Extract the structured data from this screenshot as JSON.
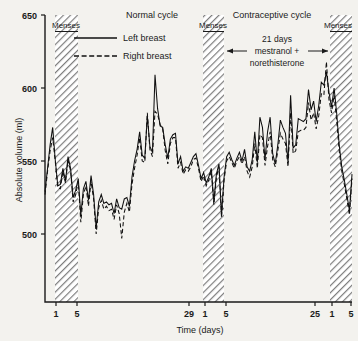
{
  "figure": {
    "background_color": "#f3f2ee",
    "ink_color": "#101010"
  },
  "headers": [
    {
      "name": "normal-cycle",
      "label": "Normal cycle",
      "x": 152
    },
    {
      "name": "contraceptive-cycle",
      "label": "Contraceptive cycle",
      "x": 272
    }
  ],
  "menses_bands": [
    {
      "name": "menses-band-1",
      "label": "Menses",
      "x_start": 55,
      "x_end": 78,
      "label_x": 66
    },
    {
      "name": "menses-band-2",
      "label": "Menses",
      "x_start": 203,
      "x_end": 224,
      "label_x": 213
    },
    {
      "name": "menses-band-3",
      "label": "Menses",
      "x_start": 330,
      "x_end": 352,
      "label_x": 338
    }
  ],
  "legend": {
    "items": [
      {
        "name": "legend-left-breast",
        "label": "Left breast",
        "style": "solid"
      },
      {
        "name": "legend-right-breast",
        "label": "Right breast",
        "style": "dashed"
      }
    ]
  },
  "annotation": {
    "line1": "21 days",
    "line2": "mestranol +",
    "line3": "norethisterone",
    "arrow_left_x": 227,
    "arrow_right_x": 328
  },
  "axes": {
    "y": {
      "title": "Absolute volume (ml)",
      "ticks": [
        650,
        600,
        550,
        500
      ],
      "min": 470,
      "max": 650
    },
    "x": {
      "title": "Time (days)",
      "ticks": [
        {
          "label": "1",
          "x": 56
        },
        {
          "label": "5",
          "x": 77
        },
        {
          "label": "29",
          "x": 189
        },
        {
          "label": "1",
          "x": 205
        },
        {
          "label": "5",
          "x": 226
        },
        {
          "label": "25",
          "x": 315
        },
        {
          "label": "1",
          "x": 332
        },
        {
          "label": "5",
          "x": 351
        }
      ]
    }
  },
  "chart_data": {
    "type": "line",
    "xlabel": "Time (days)",
    "ylabel": "Absolute volume (ml)",
    "ylim": [
      470,
      650
    ],
    "xlim": [
      0,
      120
    ],
    "grid": false,
    "legend_position": "top-left-inside",
    "yticks": [
      500,
      550,
      600,
      650
    ],
    "annotations": [
      "Normal cycle",
      "Contraceptive cycle",
      "Menses",
      "21 days mestranol + norethisterone"
    ],
    "x": [
      0,
      1,
      2,
      3,
      4,
      5,
      6,
      7,
      8,
      9,
      10,
      11,
      12,
      13,
      14,
      15,
      16,
      17,
      18,
      19,
      20,
      21,
      22,
      23,
      24,
      25,
      26,
      27,
      28,
      29,
      30,
      31,
      32,
      33,
      34,
      35,
      36,
      37,
      38,
      39,
      40,
      41,
      42,
      43,
      44,
      45,
      46,
      47,
      48,
      49,
      50,
      51,
      52,
      53,
      54,
      55,
      56,
      57,
      58,
      59,
      60,
      61,
      62,
      63,
      64,
      65,
      66,
      67,
      68,
      69,
      70,
      71,
      72,
      73,
      74,
      75,
      76,
      77,
      78,
      79,
      80,
      81,
      82,
      83,
      84,
      85,
      86,
      87,
      88,
      89,
      90,
      91,
      92,
      93,
      94,
      95,
      96,
      97,
      98,
      99,
      100,
      101,
      102,
      103,
      104,
      105,
      106,
      107,
      108,
      109,
      110,
      111,
      112,
      113,
      114,
      115,
      116,
      117,
      118,
      119,
      120
    ],
    "series": [
      {
        "name": "Left breast",
        "style": "solid",
        "values": [
          529,
          545,
          561,
          573,
          551,
          533,
          534,
          545,
          536,
          553,
          545,
          525,
          530,
          538,
          513,
          531,
          536,
          523,
          540,
          527,
          504,
          522,
          527,
          521,
          522,
          520,
          521,
          514,
          524,
          518,
          517,
          524,
          525,
          519,
          539,
          550,
          558,
          570,
          554,
          552,
          581,
          560,
          556,
          609,
          586,
          574,
          573,
          561,
          552,
          565,
          568,
          569,
          548,
          553,
          543,
          546,
          545,
          549,
          553,
          555,
          547,
          538,
          542,
          535,
          539,
          545,
          522,
          541,
          548,
          513,
          539,
          553,
          556,
          551,
          547,
          552,
          556,
          550,
          558,
          546,
          543,
          551,
          570,
          549,
          580,
          573,
          551,
          570,
          580,
          555,
          548,
          561,
          578,
          573,
          569,
          549,
          595,
          559,
          561,
          579,
          578,
          577,
          579,
          599,
          585,
          591,
          577,
          588,
          604,
          602,
          611,
          597,
          587,
          600,
          583,
          561,
          546,
          537,
          527,
          516,
          541
        ]
      },
      {
        "name": "Right breast",
        "style": "dashed",
        "values": [
          527,
          543,
          557,
          566,
          550,
          532,
          531,
          543,
          535,
          551,
          543,
          522,
          527,
          536,
          508,
          527,
          533,
          519,
          536,
          524,
          500,
          518,
          523,
          517,
          519,
          516,
          517,
          510,
          520,
          514,
          497,
          515,
          521,
          515,
          534,
          545,
          554,
          566,
          550,
          549,
          583,
          558,
          553,
          584,
          582,
          575,
          572,
          557,
          548,
          562,
          566,
          566,
          545,
          549,
          541,
          544,
          543,
          546,
          551,
          552,
          545,
          536,
          540,
          533,
          537,
          543,
          520,
          539,
          546,
          511,
          537,
          550,
          553,
          549,
          545,
          550,
          553,
          548,
          553,
          543,
          539,
          546,
          562,
          545,
          568,
          566,
          547,
          560,
          570,
          551,
          546,
          557,
          569,
          565,
          562,
          546,
          583,
          555,
          557,
          570,
          571,
          571,
          573,
          590,
          578,
          583,
          572,
          581,
          596,
          595,
          618,
          592,
          583,
          595,
          578,
          557,
          543,
          534,
          524,
          513,
          538
        ]
      }
    ]
  },
  "plot_geometry": {
    "left": 45,
    "right": 352,
    "top": 15,
    "bottom": 302
  }
}
